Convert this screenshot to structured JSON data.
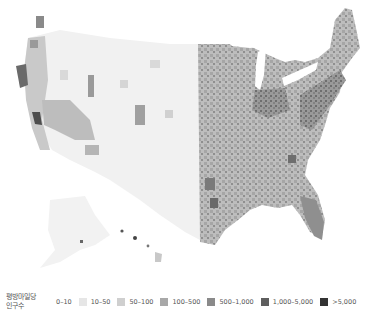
{
  "map": {
    "title": "US population density by county",
    "regions_shown": [
      "Contiguous United States",
      "Alaska",
      "Hawaii"
    ],
    "land_base_color": "#f0f0f0",
    "water_color": "#ffffff"
  },
  "legend": {
    "title_line1": "평방마일당",
    "title_line2": "인구수",
    "items": [
      {
        "label": "0–10",
        "color": "#ffffff"
      },
      {
        "label": "10–50",
        "color": "#e6e6e6"
      },
      {
        "label": "50–100",
        "color": "#cfcfcf"
      },
      {
        "label": "100–500",
        "color": "#a8a8a8"
      },
      {
        "label": "500–1,000",
        "color": "#8a8a8a"
      },
      {
        "label": "1,000–5,000",
        "color": "#5e5e5e"
      },
      {
        "label": ">5,000",
        "color": "#333333"
      }
    ]
  }
}
